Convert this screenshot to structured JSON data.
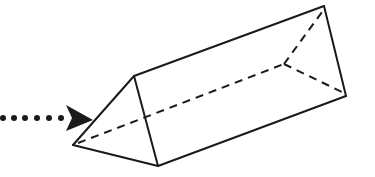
{
  "figure": {
    "colors": {
      "stroke": "#1a1a1a",
      "background": "#ffffff"
    },
    "prism": {
      "front_face": {
        "apex": [
          73,
          145
        ],
        "top": [
          134,
          76
        ],
        "bottom": [
          158,
          166
        ]
      },
      "back_face": {
        "top": [
          324,
          6
        ],
        "bottom": [
          346,
          96
        ],
        "hidden": [
          284,
          64
        ]
      }
    },
    "arrow": {
      "style": "dotted",
      "dots": [
        [
          3,
          118
        ],
        [
          14,
          118
        ],
        [
          25,
          118
        ],
        [
          37,
          118
        ],
        [
          49,
          118
        ],
        [
          61,
          118
        ]
      ],
      "head": {
        "tip": [
          93,
          120
        ],
        "back_top": [
          66,
          105
        ],
        "notch": [
          72,
          118
        ],
        "back_bottom": [
          66,
          131
        ]
      }
    }
  }
}
